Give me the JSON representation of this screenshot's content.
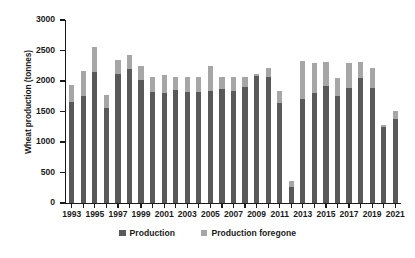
{
  "chart_data": {
    "type": "bar",
    "stacked": true,
    "title": "",
    "xlabel": "",
    "ylabel": "Wheat production (tonnes)",
    "ylim": [
      0,
      3000
    ],
    "ytick_step": 500,
    "yticks": [
      0,
      500,
      1000,
      1500,
      2000,
      2500,
      3000
    ],
    "ytick_labels": [
      "0",
      "500",
      "1000",
      "1500",
      "2000",
      "2500",
      "3000"
    ],
    "grid": false,
    "legend_position": "bottom",
    "categories": [
      "1993",
      "1994",
      "1995",
      "1996",
      "1997",
      "1998",
      "1999",
      "2000",
      "2001",
      "2002",
      "2003",
      "2004",
      "2005",
      "2006",
      "2007",
      "2008",
      "2009",
      "2010",
      "2011",
      "2012",
      "2013",
      "2014",
      "2015",
      "2016",
      "2017",
      "2018",
      "2019",
      "2020",
      "2021"
    ],
    "xtick_labels": [
      "1993",
      "1995",
      "1997",
      "1999",
      "2001",
      "2003",
      "2005",
      "2007",
      "2009",
      "2011",
      "2013",
      "2015",
      "2017",
      "2019",
      "2021"
    ],
    "series": [
      {
        "name": "Production",
        "color": "#595959",
        "values": [
          1650,
          1760,
          2150,
          1560,
          2120,
          2190,
          2020,
          1820,
          1800,
          1850,
          1820,
          1820,
          1840,
          1870,
          1840,
          1900,
          2080,
          2060,
          1640,
          270,
          1700,
          1800,
          1920,
          1750,
          1880,
          2050,
          1880,
          1250,
          1380
        ]
      },
      {
        "name": "Production foregone",
        "color": "#a6a6a6",
        "values": [
          280,
          400,
          410,
          210,
          230,
          230,
          220,
          240,
          300,
          220,
          240,
          240,
          410,
          200,
          220,
          170,
          30,
          150,
          200,
          90,
          630,
          500,
          400,
          300,
          420,
          260,
          340,
          30,
          130
        ]
      }
    ],
    "totals": [
      1930,
      2160,
      2560,
      1770,
      2350,
      2420,
      2240,
      2060,
      2100,
      2070,
      2060,
      2060,
      2250,
      2070,
      2060,
      2070,
      2110,
      2210,
      1840,
      360,
      2330,
      2300,
      2320,
      2050,
      2300,
      2310,
      2220,
      1280,
      1510
    ]
  },
  "legend": {
    "items": [
      {
        "label": "Production",
        "swatch": "#595959"
      },
      {
        "label": "Production foregone",
        "swatch": "#a6a6a6"
      }
    ]
  }
}
